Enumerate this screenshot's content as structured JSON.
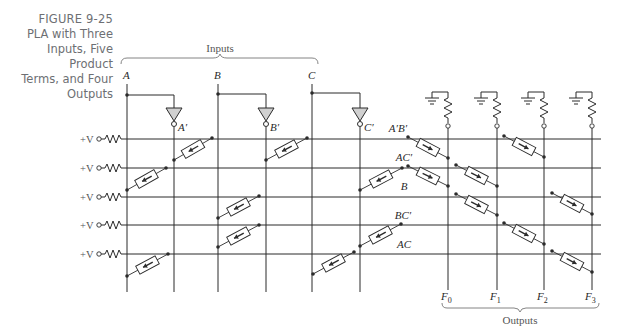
{
  "caption": {
    "figure_number": "FIGURE 9-25",
    "lines": [
      "PLA with Three",
      "Inputs, Five Product",
      "Terms, and Four",
      "Outputs"
    ]
  },
  "diagram": {
    "inputs_label": "Inputs",
    "outputs_label": "Outputs",
    "input_lines": [
      {
        "name": "A",
        "x": 127,
        "label": "A"
      },
      {
        "name": "A'",
        "x": 174,
        "label": "A′"
      },
      {
        "name": "B",
        "x": 218,
        "label": "B"
      },
      {
        "name": "B'",
        "x": 266,
        "label": "B′"
      },
      {
        "name": "C",
        "x": 312,
        "label": "C"
      },
      {
        "name": "C'",
        "x": 360,
        "label": "C′"
      }
    ],
    "product_terms": [
      {
        "label": "A′B′",
        "y": 139,
        "supply": "+V"
      },
      {
        "label": "AC′",
        "y": 168,
        "supply": "+V"
      },
      {
        "label": "B",
        "y": 197,
        "supply": "+V"
      },
      {
        "label": "BC′",
        "y": 225,
        "supply": "+V"
      },
      {
        "label": "AC",
        "y": 254,
        "supply": "+V"
      }
    ],
    "outputs": [
      {
        "label": "F",
        "sub": "0",
        "x": 448
      },
      {
        "label": "F",
        "sub": "1",
        "x": 497
      },
      {
        "label": "F",
        "sub": "2",
        "x": 544
      },
      {
        "label": "F",
        "sub": "3",
        "x": 592
      }
    ],
    "and_array_fuses": [
      {
        "row": 0,
        "from": [
          212,
          138
        ],
        "to": [
          174,
          160
        ]
      },
      {
        "row": 0,
        "from": [
          307,
          138
        ],
        "to": [
          266,
          160
        ]
      },
      {
        "row": 1,
        "from": [
          166,
          168
        ],
        "to": [
          127,
          190
        ]
      },
      {
        "row": 1,
        "from": [
          402,
          168
        ],
        "to": [
          360,
          190
        ]
      },
      {
        "row": 2,
        "from": [
          259,
          196
        ],
        "to": [
          218,
          218
        ]
      },
      {
        "row": 3,
        "from": [
          259,
          225
        ],
        "to": [
          218,
          247
        ]
      },
      {
        "row": 3,
        "from": [
          401,
          224
        ],
        "to": [
          360,
          246
        ]
      },
      {
        "row": 4,
        "from": [
          168,
          254
        ],
        "to": [
          127,
          276
        ]
      },
      {
        "row": 4,
        "from": [
          354,
          252
        ],
        "to": [
          313,
          274
        ]
      }
    ],
    "or_array_fuses": [
      {
        "row": 0,
        "from": [
          408,
          137
        ],
        "to": [
          448,
          158
        ]
      },
      {
        "row": 0,
        "from": [
          504,
          136
        ],
        "to": [
          544,
          157
        ]
      },
      {
        "row": 1,
        "from": [
          408,
          166
        ],
        "to": [
          448,
          186
        ]
      },
      {
        "row": 1,
        "from": [
          456,
          165
        ],
        "to": [
          497,
          186
        ]
      },
      {
        "row": 2,
        "from": [
          456,
          194
        ],
        "to": [
          497,
          215
        ]
      },
      {
        "row": 2,
        "from": [
          552,
          193
        ],
        "to": [
          592,
          214
        ]
      },
      {
        "row": 3,
        "from": [
          504,
          223
        ],
        "to": [
          544,
          244
        ]
      },
      {
        "row": 4,
        "from": [
          552,
          251
        ],
        "to": [
          592,
          272
        ]
      }
    ],
    "colors": {
      "line": "#2b2b2b",
      "inverter_fill": "#d0d0d0",
      "caption": "#6d6f73"
    }
  }
}
